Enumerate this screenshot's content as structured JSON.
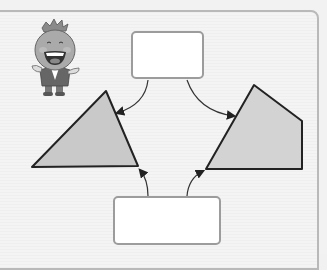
{
  "diagram": {
    "type": "classification-worksheet",
    "boxes": {
      "top": {
        "text": ""
      },
      "bottom": {
        "text": ""
      }
    },
    "shapes": [
      {
        "name": "triangle",
        "fill": "#c9c9c9",
        "stroke": "#222222"
      },
      {
        "name": "pentagon",
        "fill": "#d3d3d3",
        "stroke": "#222222"
      }
    ],
    "arrows": [
      {
        "from": "top-box",
        "to": "triangle"
      },
      {
        "from": "top-box",
        "to": "pentagon"
      },
      {
        "from": "bottom-box",
        "to": "triangle"
      },
      {
        "from": "bottom-box",
        "to": "pentagon"
      }
    ],
    "mascot": {
      "description": "cartoon onion-head character pointing"
    }
  },
  "colors": {
    "background": "#f2f2f2",
    "frame_border": "#b9b9b9",
    "box_border": "#9c9c9c",
    "shape_fill": "#cccccc",
    "line": "#222222"
  }
}
